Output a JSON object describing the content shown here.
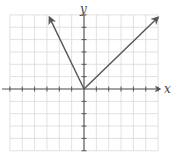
{
  "chart_data": {
    "type": "line",
    "title": "",
    "xlabel": "x",
    "ylabel": "y",
    "xlim": [
      -6,
      6
    ],
    "ylim": [
      -5,
      6
    ],
    "grid": true,
    "tick_labels": false,
    "ticks": {
      "x": [
        -6,
        -5,
        -4,
        -3,
        -2,
        -1,
        1,
        2,
        3,
        4,
        5,
        6
      ],
      "y": [
        -5,
        -4,
        -3,
        -2,
        -1,
        1,
        2,
        3,
        4,
        5,
        6
      ]
    },
    "series": [
      {
        "name": "left-branch",
        "description": "ray from origin going up-left with arrowhead",
        "x": [
          0,
          -2.8
        ],
        "y": [
          0,
          5.8
        ]
      },
      {
        "name": "right-branch",
        "description": "ray from origin going up-right with arrowhead",
        "x": [
          0,
          6
        ],
        "y": [
          0,
          5.8
        ]
      }
    ],
    "legend": null
  },
  "labels": {
    "x_axis": "x",
    "y_axis": "y"
  },
  "colors": {
    "grid": "#d9d9d9",
    "axis": "#555555",
    "curve": "#555555",
    "background": "#ffffff"
  }
}
